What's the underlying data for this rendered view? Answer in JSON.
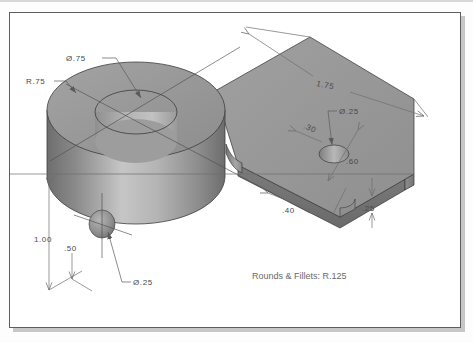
{
  "document": {
    "type": "isometric-technical-drawing",
    "title": "Machined Block with Cylindrical Boss",
    "note": "Rounds & Fillets: R.125",
    "page_background": "#ffffff",
    "border_color": "#5d5d5d",
    "canvas_background": "#fdfdfd"
  },
  "model": {
    "description": "Isometric shaded solid: large vertical cylinder (boss) with a through hole, joined to a flat rectangular arm containing a smaller through hole",
    "shading": {
      "top_face": "#9a9a9a",
      "front_left_face": "#8c8c8c",
      "front_right_face": "#a5a5a5",
      "cylinder_light": "#c8c8c8",
      "cylinder_dark": "#7d7d7d",
      "bore_inner": "#a8a8a8",
      "arm_side_face": "#6f6f6f",
      "outline": "#3c3c3c"
    }
  },
  "dimensions": [
    {
      "id": "bore-dia",
      "label": "Ø.75",
      "meaning": "diameter of large through hole in cylindrical boss"
    },
    {
      "id": "boss-radius",
      "label": "R.75",
      "meaning": "radius of cylindrical boss outer wall"
    },
    {
      "id": "arm-length",
      "label": "1.75",
      "meaning": "overall length of rectangular arm"
    },
    {
      "id": "arm-hole-dia",
      "label": "Ø.25",
      "meaning": "diameter of through hole in arm"
    },
    {
      "id": "arm-hole-offset",
      "label": ".30",
      "meaning": "offset to arm hole center"
    },
    {
      "id": "arm-width",
      "label": ".60",
      "meaning": "width of rectangular arm"
    },
    {
      "id": "arm-hole-dist",
      "label": ".40",
      "meaning": "distance from arm end to hole center"
    },
    {
      "id": "arm-thickness",
      "label": ".25",
      "meaning": "thickness of rectangular arm"
    },
    {
      "id": "overall-height",
      "label": "1.00",
      "meaning": "overall height of cylindrical boss"
    },
    {
      "id": "side-hole-height",
      "label": ".50",
      "meaning": "height to center of side hole"
    },
    {
      "id": "side-hole-dia",
      "label": "Ø.25",
      "meaning": "diameter of side hole in cylinder wall"
    }
  ]
}
